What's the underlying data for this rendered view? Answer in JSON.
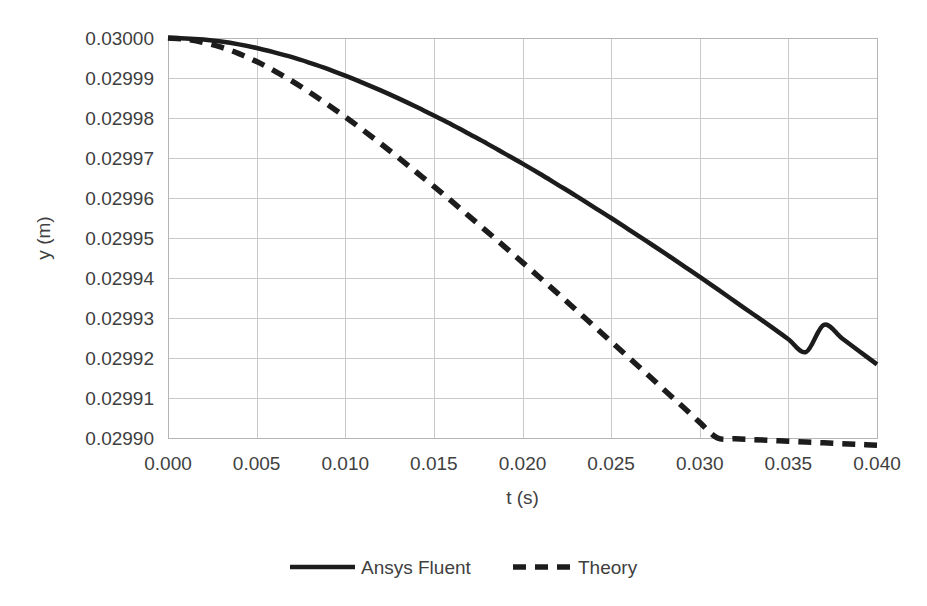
{
  "chart_data": {
    "type": "line",
    "title": "",
    "xlabel": "t (s)",
    "ylabel": "y (m)",
    "xlim": [
      0.0,
      0.04
    ],
    "ylim": [
      0.0299,
      0.03
    ],
    "grid": true,
    "legend_position": "bottom",
    "x_ticks": [
      "0.000",
      "0.005",
      "0.010",
      "0.015",
      "0.020",
      "0.025",
      "0.030",
      "0.035",
      "0.040"
    ],
    "x_tick_values": [
      0.0,
      0.005,
      0.01,
      0.015,
      0.02,
      0.025,
      0.03,
      0.035,
      0.04
    ],
    "y_ticks": [
      "0.02990",
      "0.02991",
      "0.02992",
      "0.02993",
      "0.02994",
      "0.02995",
      "0.02996",
      "0.02997",
      "0.02998",
      "0.02999",
      "0.03000"
    ],
    "y_tick_values": [
      0.0299,
      0.02991,
      0.02992,
      0.02993,
      0.02994,
      0.02995,
      0.02996,
      0.02997,
      0.02998,
      0.02999,
      0.03
    ],
    "series": [
      {
        "name": "Ansys Fluent",
        "style": "solid",
        "color": "#1c1c1c",
        "x": [
          0.0,
          0.001,
          0.002,
          0.003,
          0.004,
          0.005,
          0.006,
          0.007,
          0.008,
          0.009,
          0.01,
          0.011,
          0.012,
          0.013,
          0.014,
          0.015,
          0.016,
          0.017,
          0.018,
          0.019,
          0.02,
          0.021,
          0.022,
          0.023,
          0.024,
          0.025,
          0.026,
          0.027,
          0.028,
          0.029,
          0.03,
          0.031,
          0.032,
          0.033,
          0.034,
          0.035,
          0.036,
          0.037,
          0.038,
          0.039,
          0.04
        ],
        "y": [
          0.03,
          0.0299999,
          0.0299996,
          0.0299991,
          0.0299984,
          0.0299975,
          0.0299964,
          0.0299952,
          0.0299938,
          0.0299923,
          0.0299906,
          0.0299888,
          0.0299869,
          0.0299849,
          0.0299828,
          0.0299806,
          0.0299784,
          0.029976,
          0.0299736,
          0.0299711,
          0.0299686,
          0.029966,
          0.0299633,
          0.0299606,
          0.0299578,
          0.029955,
          0.0299521,
          0.0299492,
          0.0299463,
          0.0299433,
          0.0299403,
          0.0299372,
          0.0299341,
          0.029931,
          0.0299279,
          0.0299247,
          0.0299215,
          0.0299283,
          0.029925,
          0.0299217,
          0.0299184
        ]
      },
      {
        "name": "Theory",
        "style": "dashed",
        "color": "#1c1c1c",
        "x": [
          0.0,
          0.001,
          0.002,
          0.003,
          0.004,
          0.005,
          0.006,
          0.007,
          0.008,
          0.009,
          0.01,
          0.011,
          0.012,
          0.013,
          0.014,
          0.015,
          0.016,
          0.017,
          0.018,
          0.019,
          0.02,
          0.021,
          0.022,
          0.023,
          0.024,
          0.025,
          0.026,
          0.027,
          0.028,
          0.029,
          0.03,
          0.031,
          0.032,
          0.033,
          0.034,
          0.035,
          0.036,
          0.037,
          0.038,
          0.039,
          0.04
        ],
        "y": [
          0.03,
          0.0299997,
          0.0299989,
          0.0299977,
          0.0299961,
          0.0299941,
          0.0299918,
          0.0299892,
          0.0299864,
          0.0299834,
          0.0299803,
          0.029977,
          0.0299736,
          0.0299701,
          0.0299665,
          0.0299629,
          0.0299592,
          0.0299554,
          0.0299516,
          0.0299478,
          0.0299439,
          0.02994,
          0.0299361,
          0.0299321,
          0.0299281,
          0.0299241,
          0.0299201,
          0.0299161,
          0.029912,
          0.029908,
          0.0299039,
          0.0299,
          0.0298998,
          0.0298996,
          0.0298994,
          0.0298992,
          0.029899,
          0.0298988,
          0.0298986,
          0.0298984,
          0.0298982
        ]
      }
    ],
    "legend": [
      {
        "label": "Ansys Fluent",
        "style": "solid"
      },
      {
        "label": "Theory",
        "style": "dashed"
      }
    ]
  }
}
